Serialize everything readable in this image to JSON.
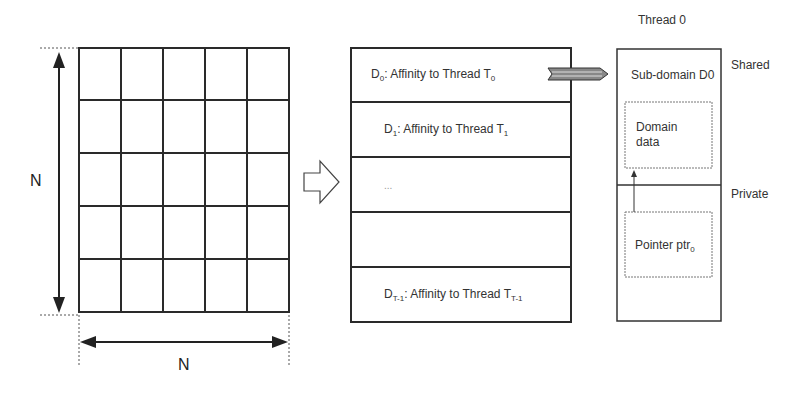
{
  "grid": {
    "rows": 5,
    "cols": 5,
    "height_label": "N",
    "width_label": "N"
  },
  "domains": {
    "rows": [
      {
        "prefix": "D",
        "sub": "0",
        "text": ": Affinity to Thread T",
        "thread_sub": "0"
      },
      {
        "prefix": "D",
        "sub": "1",
        "text": ": Affinity to Thread T",
        "thread_sub": "1"
      },
      {
        "text": "..."
      },
      {
        "text": ""
      },
      {
        "prefix": "D",
        "sub": "T-1",
        "text": ": Affinity to Thread T",
        "thread_sub": "T-1"
      }
    ]
  },
  "thread": {
    "title": "Thread 0",
    "subdomain_label": "Sub-domain D0",
    "domain_data_label": "Domain data",
    "domain_data_line1": "Domain",
    "domain_data_line2": "data",
    "pointer_label": "Pointer ptr",
    "pointer_sub": "0",
    "shared_label": "Shared",
    "private_label": "Private"
  }
}
